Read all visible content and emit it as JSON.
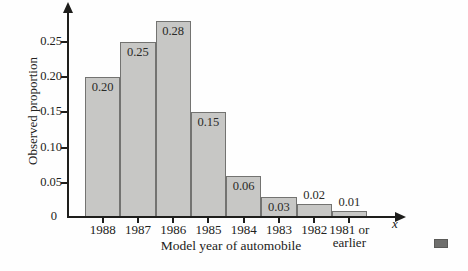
{
  "figure": {
    "bar_fill": "#c7c7c5",
    "bar_border": "#737371",
    "axis_color": "#1e1e1c",
    "end_marker_color": "#6f6f6d"
  },
  "chart_data": {
    "type": "bar",
    "title": "",
    "xlabel": "Model year of automobile",
    "ylabel": "Observed proportion",
    "x_axis_symbol": "x",
    "categories": [
      "1988",
      "1987",
      "1986",
      "1985",
      "1984",
      "1983",
      "1982",
      "1981 or\nearlier"
    ],
    "values": [
      0.2,
      0.25,
      0.28,
      0.15,
      0.06,
      0.03,
      0.02,
      0.01
    ],
    "bar_labels": [
      "0.20",
      "0.25",
      "0.28",
      "0.15",
      "0.06",
      "0.03",
      "0.02",
      "0.01"
    ],
    "y_ticks": [
      0,
      0.05,
      0.1,
      0.15,
      0.2,
      0.25
    ],
    "y_tick_labels": [
      "0",
      "0.05",
      "0.10",
      "0.15",
      "0.20",
      "0.25"
    ],
    "ylim": [
      0,
      0.3
    ],
    "grid": false,
    "legend": null
  }
}
